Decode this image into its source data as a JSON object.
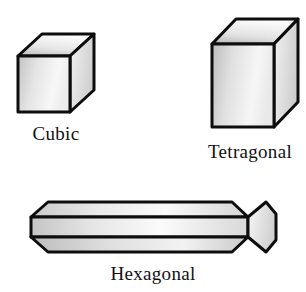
{
  "figure": {
    "background_color": "#ffffff",
    "outline_color": "#0d0d0d",
    "fill_light": "#fdfdfd",
    "fill_mid": "#d9d9d9",
    "fill_dark": "#b5b5b5",
    "width": 306,
    "height": 292
  },
  "shapes": [
    {
      "id": "cubic",
      "label": "Cubic",
      "type": "cube",
      "icon": "cube-icon",
      "faces": [
        "top",
        "front",
        "right"
      ]
    },
    {
      "id": "tetragonal",
      "label": "Tetragonal",
      "type": "rectangular-prism",
      "icon": "rectangular-prism-icon",
      "faces": [
        "top",
        "front",
        "right"
      ]
    },
    {
      "id": "hexagonal",
      "label": "Hexagonal",
      "type": "hexagonal-prism",
      "icon": "hexagonal-prism-icon",
      "faces": [
        "top",
        "front",
        "end-hexagon",
        "bevel"
      ]
    }
  ]
}
